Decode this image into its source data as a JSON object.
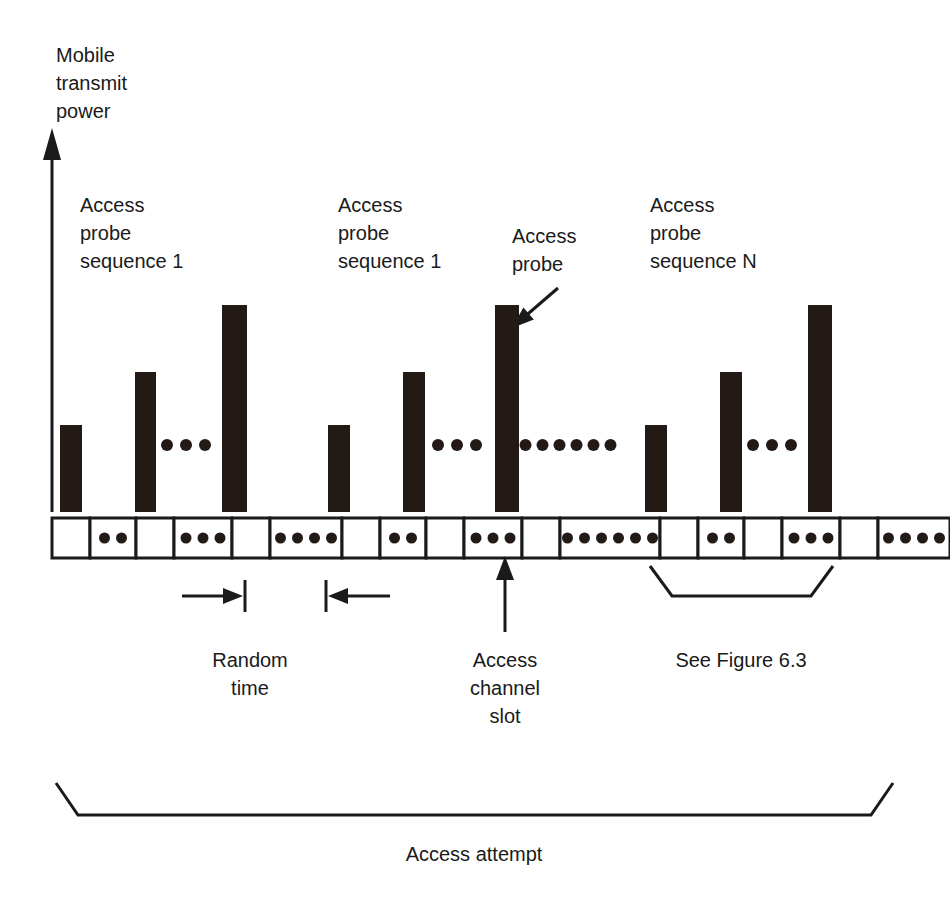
{
  "figure": {
    "kind": "timing-diagram",
    "title_axis": {
      "lines": [
        "Mobile",
        "transmit",
        "power"
      ]
    },
    "colors": {
      "ink": "#1a1a1a",
      "bar_fill": "#231a16",
      "background": "#ffffff",
      "slot_fill": "#ffffff"
    },
    "labels": {
      "group_left_l1": "Access",
      "group_left_l2": "probe",
      "group_left_l3": "sequence 1",
      "group_mid_l1": "Access",
      "group_mid_l2": "probe",
      "group_mid_l3": "sequence 1",
      "probe_callout_l1": "Access",
      "probe_callout_l2": "probe",
      "group_right_l1": "Access",
      "group_right_l2": "probe",
      "group_right_l3": "sequence N",
      "random_time_l1": "Random",
      "random_time_l2": "time",
      "channel_slot_l1": "Access",
      "channel_slot_l2": "channel",
      "channel_slot_l3": "slot",
      "see_figure": "See Figure 6.3",
      "access_attempt": "Access attempt"
    },
    "bars": [
      {
        "id": "probe-1-1",
        "x": 60,
        "w": 22,
        "top": 425,
        "sequence": 1,
        "index": 1
      },
      {
        "id": "probe-1-2",
        "x": 135,
        "w": 21,
        "top": 372,
        "sequence": 1,
        "index": 2
      },
      {
        "id": "probe-1-n",
        "x": 222,
        "w": 25,
        "top": 305,
        "sequence": 1,
        "index": 3
      },
      {
        "id": "probe-2-1",
        "x": 328,
        "w": 22,
        "top": 425,
        "sequence": 2,
        "index": 1
      },
      {
        "id": "probe-2-2",
        "x": 403,
        "w": 22,
        "top": 372,
        "sequence": 2,
        "index": 2
      },
      {
        "id": "probe-2-n",
        "x": 495,
        "w": 24,
        "top": 305,
        "sequence": 2,
        "index": 3
      },
      {
        "id": "probe-n-1",
        "x": 645,
        "w": 22,
        "top": 425,
        "sequence": 3,
        "index": 1
      },
      {
        "id": "probe-n-2",
        "x": 720,
        "w": 22,
        "top": 372,
        "sequence": 3,
        "index": 2
      },
      {
        "id": "probe-n-n",
        "x": 808,
        "w": 24,
        "top": 305,
        "sequence": 3,
        "index": 3
      }
    ],
    "bar_baseline": 512,
    "ellipsis_groups": [
      {
        "id": "ellipsis-seq1-bars",
        "cx": 186,
        "cy": 445,
        "count": 3,
        "gap": 19,
        "r": 6
      },
      {
        "id": "ellipsis-seq2-bars",
        "cx": 457,
        "cy": 445,
        "count": 3,
        "gap": 19,
        "r": 6
      },
      {
        "id": "ellipsis-between-sequences",
        "cx": 568,
        "cy": 445,
        "count": 6,
        "gap": 17,
        "r": 6
      },
      {
        "id": "ellipsis-seqn-bars",
        "cx": 772,
        "cy": 445,
        "count": 3,
        "gap": 19,
        "r": 6
      }
    ],
    "slot_row": {
      "x": 52,
      "y": 518,
      "height": 40,
      "slots": [
        {
          "id": "slot-1",
          "w": 38,
          "dots": 0
        },
        {
          "id": "slot-2",
          "w": 46,
          "dots": 2
        },
        {
          "id": "slot-3",
          "w": 38,
          "dots": 0
        },
        {
          "id": "slot-4",
          "w": 58,
          "dots": 3
        },
        {
          "id": "slot-5",
          "w": 38,
          "dots": 0
        },
        {
          "id": "slot-6",
          "w": 72,
          "dots": 4
        },
        {
          "id": "slot-7",
          "w": 38,
          "dots": 0
        },
        {
          "id": "slot-8",
          "w": 46,
          "dots": 2
        },
        {
          "id": "slot-9",
          "w": 38,
          "dots": 0
        },
        {
          "id": "slot-10",
          "w": 58,
          "dots": 3
        },
        {
          "id": "slot-11",
          "w": 38,
          "dots": 0
        },
        {
          "id": "slot-12",
          "w": 100,
          "dots": 6
        },
        {
          "id": "slot-13",
          "w": 38,
          "dots": 0
        },
        {
          "id": "slot-14",
          "w": 46,
          "dots": 2
        },
        {
          "id": "slot-15",
          "w": 38,
          "dots": 0
        },
        {
          "id": "slot-16",
          "w": 58,
          "dots": 3
        },
        {
          "id": "slot-17",
          "w": 38,
          "dots": 0
        },
        {
          "id": "slot-18",
          "w": 72,
          "dots": 4
        }
      ]
    },
    "axis": {
      "x": 52,
      "top": 140,
      "bottom": 512
    },
    "random_time_marker": {
      "left_arrow": {
        "x1": 182,
        "x2": 243,
        "y": 596
      },
      "right_arrow": {
        "x1": 390,
        "x2": 328,
        "y": 596
      },
      "tick_left_x": 245,
      "tick_right_x": 326,
      "tick_top": 580,
      "tick_bottom": 612
    },
    "callout_arrow": {
      "x1": 558,
      "y1": 288,
      "x2": 512,
      "y2": 328
    },
    "slot_pointer": {
      "x": 505,
      "y_top": 560,
      "y_bottom": 632
    },
    "brace_figure": {
      "x1": 650,
      "x2": 833,
      "y_top": 566,
      "y_bottom": 596
    },
    "brace_attempt": {
      "x1": 56,
      "x2": 893,
      "y_top": 783,
      "y_bottom": 815
    }
  }
}
